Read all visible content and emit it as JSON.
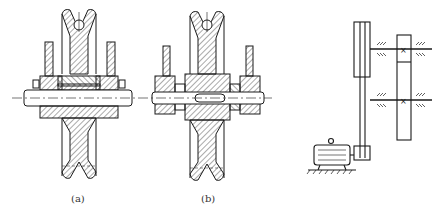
{
  "figure": {
    "panels": [
      {
        "id": "a",
        "label": "(a)",
        "content": "Sheave on axle cross-section with bearing supports"
      },
      {
        "id": "b",
        "label": "(b)",
        "content": "Sheave on keyed shaft cross-section with side supports"
      },
      {
        "id": "c",
        "label": "",
        "content": "Belt drive schematic: motor, belt, pulley, two shafts with bearings and gear pair"
      }
    ]
  },
  "colors": {
    "line": "#1a1a1a",
    "hatch": "#2a2a2a",
    "background": "#ffffff"
  }
}
